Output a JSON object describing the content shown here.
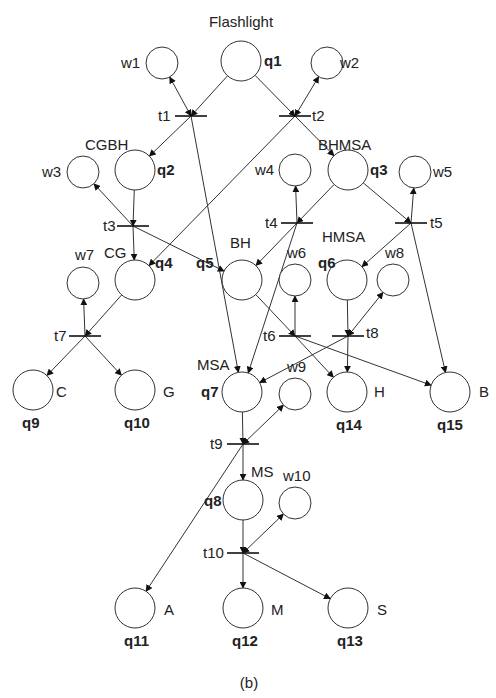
{
  "figure": {
    "title": "Flashlight",
    "caption": "(b)",
    "colors": {
      "stroke": "#333333",
      "background": "#ffffff",
      "text": "#222222"
    }
  },
  "places": [
    {
      "id": "q1",
      "cx": 241,
      "cy": 61,
      "r": 20,
      "tag": "q1",
      "state": ""
    },
    {
      "id": "q2",
      "cx": 135,
      "cy": 170,
      "r": 20,
      "tag": "q2",
      "state": "CGBH"
    },
    {
      "id": "q3",
      "cx": 348,
      "cy": 170,
      "r": 20,
      "tag": "q3",
      "state": "BHMSA"
    },
    {
      "id": "q4",
      "cx": 135,
      "cy": 280,
      "r": 20,
      "tag": "q4",
      "state": "CG"
    },
    {
      "id": "q5",
      "cx": 242,
      "cy": 280,
      "r": 20,
      "tag": "q5",
      "state": "BH"
    },
    {
      "id": "q6",
      "cx": 347,
      "cy": 280,
      "r": 20,
      "tag": "q6",
      "state": "HMSA"
    },
    {
      "id": "q7",
      "cx": 242,
      "cy": 392,
      "r": 20,
      "tag": "q7",
      "state": "MSA"
    },
    {
      "id": "q8",
      "cx": 243,
      "cy": 500,
      "r": 20,
      "tag": "q8",
      "state": "MS"
    },
    {
      "id": "q9",
      "cx": 33,
      "cy": 390,
      "r": 20,
      "tag": "q9",
      "state": "C"
    },
    {
      "id": "q10",
      "cx": 135,
      "cy": 390,
      "r": 20,
      "tag": "q10",
      "state": "G"
    },
    {
      "id": "q11",
      "cx": 135,
      "cy": 608,
      "r": 20,
      "tag": "q11",
      "state": "A"
    },
    {
      "id": "q12",
      "cx": 243,
      "cy": 608,
      "r": 20,
      "tag": "q12",
      "state": "M"
    },
    {
      "id": "q13",
      "cx": 348,
      "cy": 608,
      "r": 20,
      "tag": "q13",
      "state": "S"
    },
    {
      "id": "q14",
      "cx": 347,
      "cy": 392,
      "r": 20,
      "tag": "q14",
      "state": "H"
    },
    {
      "id": "q15",
      "cx": 450,
      "cy": 392,
      "r": 20,
      "tag": "q15",
      "state": "B"
    }
  ],
  "wait_places": [
    {
      "id": "w1",
      "cx": 162,
      "cy": 63,
      "r": 16,
      "label": "w1"
    },
    {
      "id": "w2",
      "cx": 327,
      "cy": 63,
      "r": 16,
      "label": "w2"
    },
    {
      "id": "w3",
      "cx": 83,
      "cy": 172,
      "r": 16,
      "label": "w3"
    },
    {
      "id": "w4",
      "cx": 295,
      "cy": 170,
      "r": 16,
      "label": "w4"
    },
    {
      "id": "w5",
      "cx": 415,
      "cy": 172,
      "r": 16,
      "label": "w5"
    },
    {
      "id": "w6",
      "cx": 295,
      "cy": 280,
      "r": 16,
      "label": "w6"
    },
    {
      "id": "w7",
      "cx": 83,
      "cy": 283,
      "r": 16,
      "label": "w7"
    },
    {
      "id": "w8",
      "cx": 393,
      "cy": 280,
      "r": 16,
      "label": "w8"
    },
    {
      "id": "w9",
      "cx": 295,
      "cy": 394,
      "r": 16,
      "label": "w9"
    },
    {
      "id": "w10",
      "cx": 295,
      "cy": 503,
      "r": 16,
      "label": "w10"
    }
  ],
  "transitions": [
    {
      "id": "t1",
      "x": 191,
      "y": 116,
      "label": "t1"
    },
    {
      "id": "t2",
      "x": 295,
      "y": 116,
      "label": "t2"
    },
    {
      "id": "t3",
      "x": 133,
      "y": 226,
      "label": "t3"
    },
    {
      "id": "t4",
      "x": 297,
      "y": 223,
      "label": "t4"
    },
    {
      "id": "t5",
      "x": 411,
      "y": 223,
      "label": "t5"
    },
    {
      "id": "t6",
      "x": 295,
      "y": 336,
      "label": "t6"
    },
    {
      "id": "t7",
      "x": 85,
      "y": 336,
      "label": "t7"
    },
    {
      "id": "t8",
      "x": 348,
      "y": 336,
      "label": "t8"
    },
    {
      "id": "t9",
      "x": 243,
      "y": 444,
      "label": "t9"
    },
    {
      "id": "t10",
      "x": 243,
      "y": 553,
      "label": "t10"
    }
  ],
  "arcs": [
    {
      "from": "q1",
      "to": "t1"
    },
    {
      "from": "q1",
      "to": "t2"
    },
    {
      "from": "t1",
      "to": "w1",
      "bidir": true
    },
    {
      "from": "t2",
      "to": "w2",
      "bidir": true
    },
    {
      "from": "t1",
      "to": "q2"
    },
    {
      "from": "t1",
      "to": "q7"
    },
    {
      "from": "t2",
      "to": "q3"
    },
    {
      "from": "t2",
      "to": "q4"
    },
    {
      "from": "q2",
      "to": "t3"
    },
    {
      "from": "t3",
      "to": "w3"
    },
    {
      "from": "t3",
      "to": "q4"
    },
    {
      "from": "t3",
      "to": "q5"
    },
    {
      "from": "q3",
      "to": "t4"
    },
    {
      "from": "q3",
      "to": "t5"
    },
    {
      "from": "t4",
      "to": "w4"
    },
    {
      "from": "t4",
      "to": "q5"
    },
    {
      "from": "t4",
      "to": "q7"
    },
    {
      "from": "t5",
      "to": "w5"
    },
    {
      "from": "t5",
      "to": "q6"
    },
    {
      "from": "t5",
      "to": "q15"
    },
    {
      "from": "q4",
      "to": "t7"
    },
    {
      "from": "t7",
      "to": "w7"
    },
    {
      "from": "t7",
      "to": "q9"
    },
    {
      "from": "t7",
      "to": "q10"
    },
    {
      "from": "q5",
      "to": "t6"
    },
    {
      "from": "t6",
      "to": "w6"
    },
    {
      "from": "t6",
      "to": "q14"
    },
    {
      "from": "t6",
      "to": "q15"
    },
    {
      "from": "q6",
      "to": "t8"
    },
    {
      "from": "t8",
      "to": "w8",
      "bidir": true
    },
    {
      "from": "t8",
      "to": "q14"
    },
    {
      "from": "t8",
      "to": "q7"
    },
    {
      "from": "q7",
      "to": "t9"
    },
    {
      "from": "t9",
      "to": "w9",
      "bidir": true
    },
    {
      "from": "t9",
      "to": "q8"
    },
    {
      "from": "t9",
      "to": "q11"
    },
    {
      "from": "q8",
      "to": "t10"
    },
    {
      "from": "t10",
      "to": "w10",
      "bidir": true
    },
    {
      "from": "t10",
      "to": "q12"
    },
    {
      "from": "t10",
      "to": "q13"
    }
  ],
  "labels": {
    "q1_tag": "q1",
    "q2_tag": "q2",
    "q3_tag": "q3",
    "q4_tag": "q4",
    "q5_tag": "q5",
    "q6_tag": "q6",
    "q7_tag": "q7",
    "q8_tag": "q8",
    "q9_tag": "q9",
    "q10_tag": "q10",
    "q11_tag": "q11",
    "q12_tag": "q12",
    "q13_tag": "q13",
    "q14_tag": "q14",
    "q15_tag": "q15",
    "q2_state": "CGBH",
    "q3_state": "BHMSA",
    "q4_state": "CG",
    "q5_state": "BH",
    "q6_state": "HMSA",
    "q7_state": "MSA",
    "q8_state": "MS",
    "q9_state": "C",
    "q10_state": "G",
    "q11_state": "A",
    "q12_state": "M",
    "q13_state": "S",
    "q14_state": "H",
    "q15_state": "B",
    "w1": "w1",
    "w2": "w2",
    "w3": "w3",
    "w4": "w4",
    "w5": "w5",
    "w6": "w6",
    "w7": "w7",
    "w8": "w8",
    "w9": "w9",
    "w10": "w10",
    "t1": "t1",
    "t2": "t2",
    "t3": "t3",
    "t4": "t4",
    "t5": "t5",
    "t6": "t6",
    "t7": "t7",
    "t8": "t8",
    "t9": "t9",
    "t10": "t10"
  }
}
